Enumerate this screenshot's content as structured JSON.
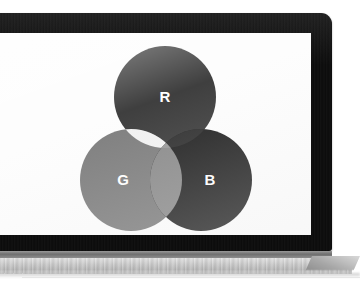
{
  "scene": {
    "subject": "laptop-displaying-rgb-venn-diagram",
    "device_label": "laptop",
    "screen_background": "#fdfdfd",
    "bezel_color": "#0c0c0c",
    "hinge_color": "#6f6f6f",
    "base_color": "#c9c9c9",
    "rendering": "grayscale-photograph"
  },
  "diagram": {
    "type": "venn",
    "set_count": 3,
    "circles": [
      {
        "id": "red",
        "label": "R",
        "label_color": "#ffffff",
        "fill": "#3f3f3f",
        "cx": 205,
        "cy": 64,
        "r": 51
      },
      {
        "id": "green",
        "label": "G",
        "label_color": "#ffffff",
        "fill": "#7f7f7f",
        "cx": 171,
        "cy": 147,
        "r": 51
      },
      {
        "id": "blue",
        "label": "B",
        "label_color": "#ffffff",
        "fill": "#262626",
        "cx": 241,
        "cy": 147,
        "r": 51
      }
    ],
    "intersections": [
      {
        "id": "red-green",
        "sets": [
          "red",
          "green"
        ],
        "fill": "#f2f2f2"
      },
      {
        "id": "red-blue",
        "sets": [
          "red",
          "blue"
        ],
        "fill": "#333333"
      },
      {
        "id": "green-blue",
        "sets": [
          "green",
          "blue"
        ],
        "fill": "#8c8c8c"
      },
      {
        "id": "red-green-blue",
        "sets": [
          "red",
          "green",
          "blue"
        ],
        "fill": "#9a9a9a"
      }
    ]
  }
}
